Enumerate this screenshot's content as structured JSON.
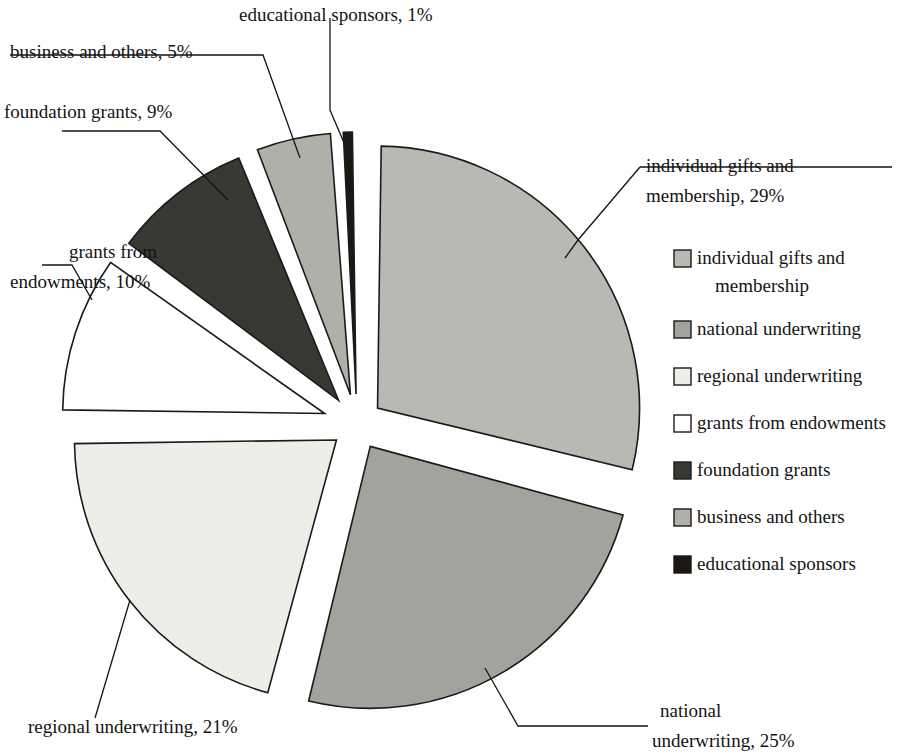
{
  "chart_data": {
    "type": "pie",
    "title": "",
    "subtitle": "",
    "xlabel": "",
    "ylabel": "",
    "grid": false,
    "legend_position": "right",
    "units": "percent",
    "total": 100,
    "exploded": true,
    "start_angle_deg": 0,
    "direction": "clockwise",
    "categories": [
      "individual gifts and membership",
      "national underwriting",
      "regional underwriting",
      "grants from endowments",
      "foundation grants",
      "business and others",
      "educational sponsors"
    ],
    "values": [
      29,
      25,
      21,
      10,
      9,
      5,
      1
    ],
    "slices": [
      {
        "label": "individual gifts and membership",
        "value": 29,
        "value_label": "29%",
        "color": "#b9b9b3",
        "callout": "individual gifts and\nmembership,  29%"
      },
      {
        "label": "national underwriting",
        "value": 25,
        "value_label": "25%",
        "color": "#a3a39d",
        "callout": "national\nunderwriting,  25%"
      },
      {
        "label": "regional underwriting",
        "value": 21,
        "value_label": "21%",
        "color": "#eeeee8",
        "callout": "regional underwriting,  21%"
      },
      {
        "label": "grants from endowments",
        "value": 10,
        "value_label": "10%",
        "color": "#ffffff",
        "callout": "grants from\nendowments,  10%"
      },
      {
        "label": "foundation grants",
        "value": 9,
        "value_label": "9%",
        "color": "#3a3833",
        "callout": "foundation grants,  9%"
      },
      {
        "label": "business and others",
        "value": 5,
        "value_label": "5%",
        "color": "#b0b0a9",
        "callout": "business and others,  5%"
      },
      {
        "label": "educational sponsors",
        "value": 1,
        "value_label": "1%",
        "color": "#1b1814",
        "callout": "educational sponsors,  1%"
      }
    ]
  },
  "callouts": {
    "educational_sponsors": "educational sponsors,  1%",
    "business_and_others": "business and others,  5%",
    "foundation_grants": "foundation grants,  9%",
    "grants_from_endowments_line1": "grants from",
    "grants_from_endowments_line2": "endowments,  10%",
    "individual_gifts_line1": "individual gifts and",
    "individual_gifts_line2": "membership,  29%",
    "regional_underwriting": "regional underwriting,  21%",
    "national_underwriting_line1": "national",
    "national_underwriting_line2": "underwriting,  25%"
  },
  "legend": {
    "items": [
      {
        "label_line1": "individual gifts and",
        "label_line2": "membership",
        "color": "#b9b9b3"
      },
      {
        "label_line1": "national underwriting",
        "label_line2": "",
        "color": "#a3a39d"
      },
      {
        "label_line1": "regional underwriting",
        "label_line2": "",
        "color": "#eeeee8"
      },
      {
        "label_line1": "grants from endowments",
        "label_line2": "",
        "color": "#ffffff"
      },
      {
        "label_line1": "foundation grants",
        "label_line2": "",
        "color": "#3a3833"
      },
      {
        "label_line1": "business and others",
        "label_line2": "",
        "color": "#b0b0a9"
      },
      {
        "label_line1": "educational sponsors",
        "label_line2": "",
        "color": "#1b1814"
      }
    ]
  },
  "style": {
    "background": "#ffffff",
    "outline": "#1a1a1a",
    "text": "#141414"
  }
}
